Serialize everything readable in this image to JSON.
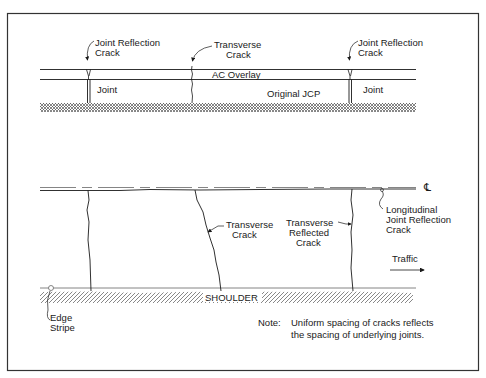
{
  "figure": {
    "type": "schematic"
  },
  "section_profile": {
    "labels": {
      "joint_reflection_crack_left_line1": "Joint Reflection",
      "joint_reflection_crack_left_line2": "Crack",
      "transverse_crack_line1": "Transverse",
      "transverse_crack_line2": "Crack",
      "joint_reflection_crack_right_line1": "Joint Reflection",
      "joint_reflection_crack_right_line2": "Crack",
      "ac_overlay": "AC Overlay",
      "original_jcp": "Original JCP",
      "joint_left": "Joint",
      "joint_right": "Joint"
    }
  },
  "plan_view": {
    "labels": {
      "centerline_symbol": "℄",
      "longitudinal_line1": "Longitudinal",
      "longitudinal_line2": "Joint Reflection",
      "longitudinal_line3": "Crack",
      "transverse_crack_line1": "Transverse",
      "transverse_crack_line2": "Crack",
      "transverse_reflected_line1": "Transverse",
      "transverse_reflected_line2": "Reflected",
      "transverse_reflected_line3": "Crack",
      "traffic": "Traffic",
      "shoulder": "SHOULDER",
      "edge_stripe_line1": "Edge",
      "edge_stripe_line2": "Stripe"
    }
  },
  "note": {
    "label": "Note:",
    "line1": "Uniform spacing of cracks reflects",
    "line2": "the spacing of underlying joints."
  },
  "colors": {
    "line": "#1a1a1a",
    "frame": "#333333",
    "hatch": "#555555",
    "background": "#ffffff"
  }
}
